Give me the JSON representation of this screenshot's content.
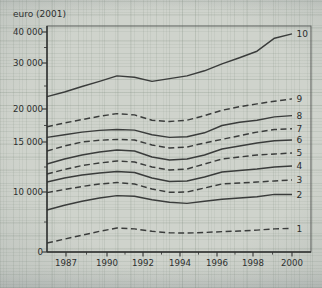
{
  "chart_data": {
    "type": "line",
    "title": "euro (2001)",
    "y_axis": {
      "unit": "euro (2001)",
      "scale": "nonlinear-ratio",
      "tick_labels": [
        "40 000",
        "30 000",
        "20 000",
        "15 000",
        "10 000",
        "0"
      ],
      "tick_values": [
        40000,
        30000,
        20000,
        15000,
        10000,
        0
      ]
    },
    "x_axis": {
      "tick_labels": [
        "1987",
        "1990",
        "1992",
        "1994",
        "1996",
        "1998",
        "2000"
      ],
      "sample_years": [
        1986,
        1987,
        1988,
        1989,
        1990,
        1991,
        1992,
        1993,
        1994,
        1995,
        1996,
        1997,
        1998,
        1999,
        2000
      ]
    },
    "legend_position": "right-edge-labels",
    "series": [
      {
        "label": "1",
        "style": "dashed",
        "values": [
          1500,
          2150,
          2800,
          3450,
          4000,
          3850,
          3450,
          3200,
          3150,
          3250,
          3400,
          3500,
          3650,
          3850,
          3950
        ]
      },
      {
        "label": "2",
        "style": "solid",
        "values": [
          7000,
          7800,
          8450,
          9000,
          9400,
          9300,
          8700,
          8300,
          8100,
          8450,
          8800,
          9000,
          9200,
          9600,
          9600
        ]
      },
      {
        "label": "3",
        "style": "dashed",
        "values": [
          9900,
          10250,
          10550,
          10800,
          10950,
          10800,
          10300,
          9950,
          10000,
          10400,
          10800,
          10900,
          11000,
          11100,
          11200
        ]
      },
      {
        "label": "4",
        "style": "solid",
        "values": [
          11000,
          11400,
          11700,
          11900,
          12050,
          11950,
          11400,
          11050,
          11100,
          11500,
          12000,
          12150,
          12300,
          12500,
          12600
        ]
      },
      {
        "label": "5",
        "style": "dashed",
        "values": [
          11800,
          12250,
          12650,
          12900,
          13100,
          13000,
          12500,
          12200,
          12300,
          12800,
          13300,
          13500,
          13700,
          13800,
          13900
        ]
      },
      {
        "label": "6",
        "style": "solid",
        "values": [
          12800,
          13300,
          13700,
          14000,
          14200,
          14100,
          13500,
          13200,
          13300,
          13700,
          14300,
          14600,
          14900,
          15200,
          15300
        ]
      },
      {
        "label": "7",
        "style": "dashed",
        "values": [
          14100,
          14600,
          15000,
          15250,
          15400,
          15300,
          14700,
          14400,
          14500,
          14900,
          15400,
          15950,
          16500,
          16900,
          17000
        ]
      },
      {
        "label": "8",
        "style": "solid",
        "values": [
          15700,
          16100,
          16500,
          16750,
          16900,
          16800,
          16100,
          15700,
          15800,
          16400,
          17500,
          18000,
          18300,
          18800,
          19000
        ]
      },
      {
        "label": "9",
        "style": "dashed",
        "values": [
          17300,
          17900,
          18400,
          18900,
          19300,
          19100,
          18300,
          18100,
          18300,
          19000,
          19800,
          20500,
          21100,
          21700,
          22200
        ]
      },
      {
        "label": "10",
        "style": "solid",
        "values": [
          22700,
          23700,
          24900,
          26000,
          27200,
          26900,
          26000,
          26600,
          27200,
          28300,
          29800,
          31700,
          33800,
          38000,
          39400
        ]
      }
    ],
    "colors": {
      "background": "#cfd3cc",
      "line": "#3a3c3b",
      "text": "#2b2d2c",
      "border": "#555856"
    }
  }
}
